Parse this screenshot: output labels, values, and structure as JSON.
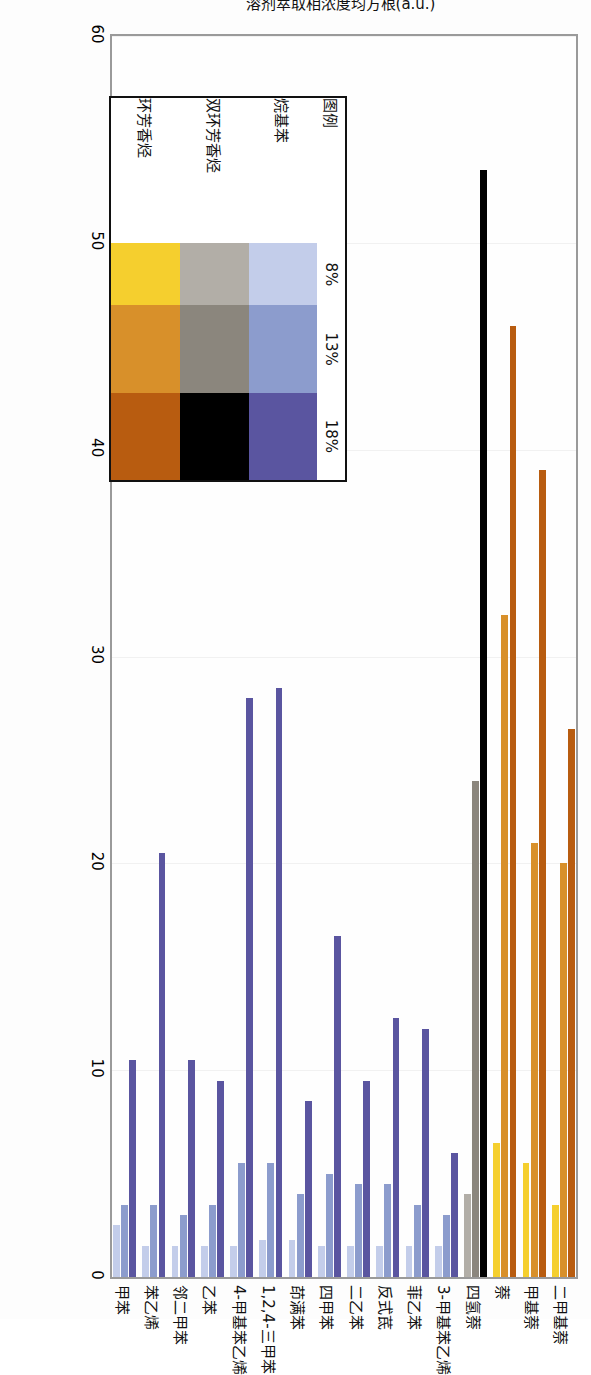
{
  "figure": {
    "axis": {
      "y_title": "溶剂萃取相浓度均方根(a.u.)",
      "ticks": [
        "0",
        "10",
        "20",
        "30",
        "40",
        "50",
        "60"
      ],
      "min": 0,
      "max": 60
    },
    "legend": {
      "title": "图例",
      "columns": [
        "8%",
        "13%",
        "18%"
      ],
      "rows": [
        {
          "label": "烷基苯",
          "colors": [
            "#c3cdea",
            "#8c9ccd",
            "#5a55a0"
          ]
        },
        {
          "label": "双环芳香烃",
          "colors": [
            "#b2aea7",
            "#8b867d",
            "#000000"
          ]
        },
        {
          "label": "环芳香烃",
          "colors": [
            "#f5cf2e",
            "#d8902a",
            "#b85c10"
          ]
        }
      ]
    }
  },
  "chart_data": {
    "type": "bar",
    "orientation": "horizontal",
    "title": "",
    "xlabel": "",
    "ylabel": "溶剂萃取相浓度均方根(a.u.)",
    "ylim": [
      0,
      60
    ],
    "grid": true,
    "legend_position": "inside-left",
    "categories": [
      "甲苯",
      "苯乙烯",
      "邻二甲苯",
      "乙苯",
      "4-甲基苯乙烯",
      "1,2,4-三甲苯",
      "茚满苯",
      "四甲苯",
      "二乙苯",
      "反式茋",
      "菲乙苯",
      "3-甲基苯乙烯",
      "四氢萘",
      "萘",
      "甲基萘",
      "二甲基萘"
    ],
    "series": [
      {
        "name": "8%",
        "values": [
          2.5,
          1.5,
          1.5,
          1.5,
          1.5,
          1.8,
          1.8,
          1.5,
          1.5,
          1.5,
          1.5,
          1.5,
          4.0,
          6.5,
          5.5,
          3.5
        ]
      },
      {
        "name": "13%",
        "values": [
          3.5,
          3.5,
          3.0,
          3.5,
          5.5,
          5.5,
          4.0,
          5.0,
          4.5,
          4.5,
          3.5,
          3.0,
          24.0,
          32.0,
          21.0,
          20.0
        ]
      },
      {
        "name": "18%",
        "values": [
          10.5,
          20.5,
          10.5,
          9.5,
          28.0,
          28.5,
          8.5,
          16.5,
          9.5,
          12.5,
          12.0,
          6.0,
          53.5,
          46.0,
          39.0,
          26.5
        ]
      }
    ],
    "series_colors": {
      "8%": [
        "#c3cdea",
        "#b2aea7",
        "#f5cf2e"
      ],
      "13%": [
        "#8c9ccd",
        "#8b867d",
        "#d8902a"
      ],
      "18%": [
        "#5a55a0",
        "#000000",
        "#b85c10"
      ]
    },
    "group_map": [
      0,
      0,
      0,
      0,
      0,
      0,
      0,
      0,
      0,
      0,
      0,
      0,
      1,
      2,
      2,
      2
    ]
  }
}
